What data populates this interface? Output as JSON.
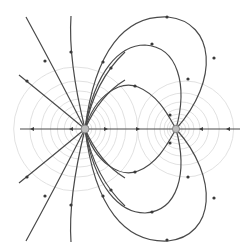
{
  "diagram": {
    "colors": {
      "background": "#ffffff",
      "field_line": "#4a4a4a",
      "equipotential": "#d9d9d9",
      "charge_fill": "#bdbdbd"
    },
    "charges": [
      {
        "id": "left-charge",
        "x": 85,
        "y": 129,
        "sign": "positive",
        "relative_size": "larger"
      },
      {
        "id": "right-charge",
        "x": 176,
        "y": 129,
        "sign": "negative",
        "relative_size": "smaller"
      }
    ],
    "axis_line": {
      "x1": 20,
      "x2": 240,
      "y": 129
    },
    "equipotential_rings": {
      "left": [
        8,
        13,
        18,
        24,
        30,
        38,
        48,
        62
      ],
      "right": [
        5,
        8,
        11,
        15,
        20,
        27,
        36,
        48
      ]
    },
    "field_line_count": 20
  }
}
